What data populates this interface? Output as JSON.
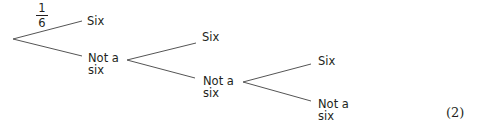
{
  "diagram": {
    "type": "tree_diagram",
    "given_probability": {
      "numerator": "1",
      "denominator": "6",
      "branch": "first-six"
    },
    "stages": [
      {
        "upper_label": "Six",
        "lower_label_line1": "Not a",
        "lower_label_line2": "six"
      },
      {
        "upper_label": "Six",
        "lower_label_line1": "Not a",
        "lower_label_line2": "six"
      },
      {
        "upper_label": "Six",
        "lower_label_line1": "Not a",
        "lower_label_line2": "six"
      }
    ],
    "marks": "(2)",
    "line_color": "#555555"
  }
}
